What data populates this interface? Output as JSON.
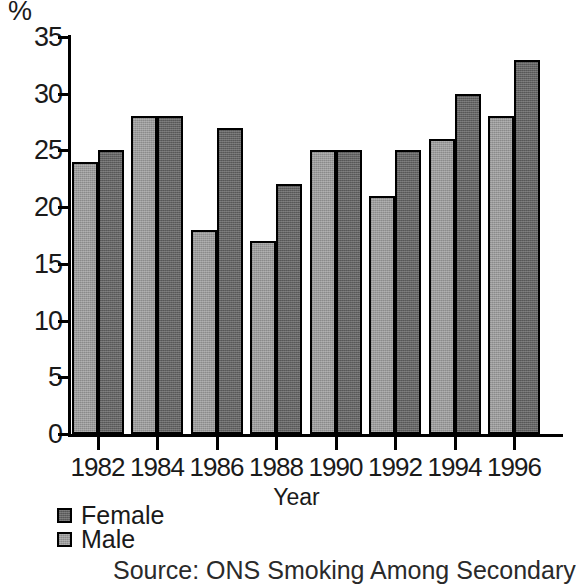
{
  "chart_data": {
    "type": "bar",
    "title": "",
    "xlabel": "Year",
    "ylabel": "%",
    "categories": [
      "1982",
      "1984",
      "1986",
      "1988",
      "1990",
      "1992",
      "1994",
      "1996"
    ],
    "series": [
      {
        "name": "Male",
        "color": "#9a9a9a",
        "values": [
          24,
          28,
          18,
          17,
          25,
          21,
          26,
          28
        ]
      },
      {
        "name": "Female",
        "color": "#636363",
        "values": [
          25,
          28,
          27,
          22,
          25,
          25,
          30,
          33
        ]
      }
    ],
    "ylim": [
      0,
      35
    ],
    "ytick_values": [
      0,
      5,
      10,
      15,
      20,
      25,
      30,
      35
    ],
    "ytick_labels": [
      "0",
      "5",
      "10",
      "15",
      "20",
      "25",
      "30",
      "35"
    ],
    "grid": false,
    "legend_position": "bottom-left",
    "legend_order": [
      "Female",
      "Male"
    ]
  },
  "axis": {
    "y_unit_label": "%",
    "x_title": "Year"
  },
  "legend": {
    "entries": [
      {
        "label": "Female",
        "swatch": "dark-gray-swatch"
      },
      {
        "label": "Male",
        "swatch": "light-gray-swatch"
      }
    ]
  },
  "source": {
    "text": "Source: ONS Smoking Among Secondary"
  }
}
